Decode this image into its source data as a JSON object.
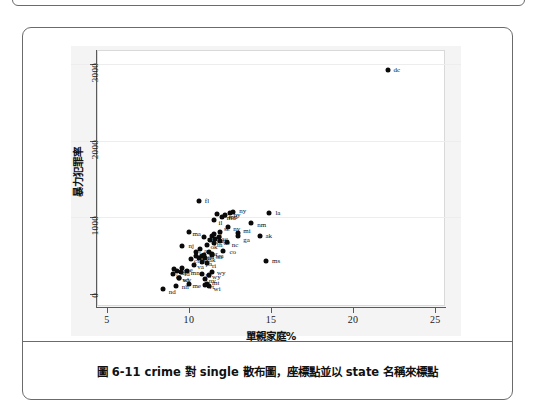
{
  "figure": {
    "caption": "圖 6-11   crime 對 single 散布圖，座標點並以 state 名稱來標點"
  },
  "chart_data": {
    "type": "scatter",
    "title": "",
    "xlabel": "單親家庭%",
    "ylabel": "暴力犯罪率",
    "xlim": [
      4.4,
      25.6
    ],
    "ylim": [
      -170,
      3180
    ],
    "xticks": [
      "5",
      "10",
      "15",
      "20",
      "25"
    ],
    "xtick_values": [
      5,
      10,
      15,
      20,
      25
    ],
    "yticks": [
      "0",
      "1000",
      "2000",
      "3000"
    ],
    "ytick_values": [
      0,
      1000,
      2000,
      3000
    ],
    "grid": true,
    "gridlines_y": [
      1000,
      2000,
      3000
    ],
    "legend": "none",
    "marker": "filled-circle",
    "marker_color": "#0a0a0a",
    "points": [
      {
        "label": "dc",
        "x": 22.1,
        "y": 2922,
        "lx": 6,
        "ly": 0
      },
      {
        "label": "fl",
        "x": 10.6,
        "y": 1206,
        "lx": 6,
        "ly": 0
      },
      {
        "label": "la",
        "x": 14.9,
        "y": 1062,
        "lx": 6,
        "ly": 0
      },
      {
        "label": "ny",
        "x": 12.7,
        "y": 1074,
        "lx": 6,
        "ly": -1
      },
      {
        "label": "md",
        "x": 12.0,
        "y": 998,
        "lx": 5,
        "ly": 1
      },
      {
        "label": "il",
        "x": 11.5,
        "y": 960,
        "lx": 5,
        "ly": 3
      },
      {
        "label": "nm",
        "x": 13.8,
        "y": 930,
        "lx": 6,
        "ly": 2
      },
      {
        "label": "nv",
        "x": 12.4,
        "y": 875,
        "lx": 5,
        "ly": 2
      },
      {
        "label": "ak",
        "x": 14.3,
        "y": 761,
        "lx": 6,
        "ly": 0
      },
      {
        "label": "mi",
        "x": 13.0,
        "y": 792,
        "lx": 5,
        "ly": -2
      },
      {
        "label": "ga",
        "x": 13.0,
        "y": 756,
        "lx": 5,
        "ly": 4
      },
      {
        "label": "nc",
        "x": 12.3,
        "y": 679,
        "lx": 5,
        "ly": 3
      },
      {
        "label": "sc",
        "x": 11.9,
        "y": 805,
        "lx": 4,
        "ly": -3
      },
      {
        "label": "nj",
        "x": 9.6,
        "y": 627,
        "lx": 6,
        "ly": 0
      },
      {
        "label": "co",
        "x": 12.1,
        "y": 567,
        "lx": 6,
        "ly": 1
      },
      {
        "label": "ms",
        "x": 14.7,
        "y": 434,
        "lx": 6,
        "ly": 0
      },
      {
        "label": "ri",
        "x": 11.1,
        "y": 402,
        "lx": 5,
        "ly": 3
      },
      {
        "label": "wy",
        "x": 11.4,
        "y": 286,
        "lx": 5,
        "ly": 1
      },
      {
        "label": "nd",
        "x": 8.4,
        "y": 68,
        "lx": 6,
        "ly": 3
      },
      {
        "label": "nh",
        "x": 9.2,
        "y": 106,
        "lx": 6,
        "ly": 1
      },
      {
        "label": "mt",
        "x": 11.1,
        "y": 135,
        "lx": 5,
        "ly": -1
      },
      {
        "label": "wi",
        "x": 11.2,
        "y": 109,
        "lx": 5,
        "ly": 3
      },
      {
        "label": "tx",
        "x": 11.4,
        "y": 762,
        "lx": 0,
        "ly": 0
      },
      {
        "label": "al",
        "x": 11.5,
        "y": 780,
        "lx": 0,
        "ly": 0
      },
      {
        "label": "ca",
        "x": 11.7,
        "y": 1041,
        "lx": 0,
        "ly": 0
      },
      {
        "label": "de",
        "x": 11.9,
        "y": 686,
        "lx": 0,
        "ly": 0
      },
      {
        "label": "tn",
        "x": 11.5,
        "y": 670,
        "lx": 0,
        "ly": 0
      },
      {
        "label": "mo",
        "x": 10.9,
        "y": 744,
        "lx": 0,
        "ly": 0
      },
      {
        "label": "ar",
        "x": 10.7,
        "y": 593,
        "lx": 0,
        "ly": 0
      },
      {
        "label": "az",
        "x": 11.6,
        "y": 715,
        "lx": 0,
        "ly": 0
      },
      {
        "label": "ok",
        "x": 11.1,
        "y": 635,
        "lx": 0,
        "ly": 0
      },
      {
        "label": "oh",
        "x": 11.4,
        "y": 504,
        "lx": 0,
        "ly": 0
      },
      {
        "label": "ak2",
        "x": 11.0,
        "y": 463,
        "lx": 0,
        "ly": 0
      },
      {
        "label": "in",
        "x": 10.8,
        "y": 489,
        "lx": 0,
        "ly": 0
      },
      {
        "label": "ks",
        "x": 10.4,
        "y": 496,
        "lx": 0,
        "ly": 0
      },
      {
        "label": "wa",
        "x": 11.4,
        "y": 515,
        "lx": 0,
        "ly": 0
      },
      {
        "label": "or",
        "x": 11.2,
        "y": 542,
        "lx": 0,
        "ly": 0
      },
      {
        "label": "pa",
        "x": 10.8,
        "y": 418,
        "lx": 0,
        "ly": 0
      },
      {
        "label": "va",
        "x": 10.3,
        "y": 372,
        "lx": 0,
        "ly": 0
      },
      {
        "label": "ct",
        "x": 10.1,
        "y": 456,
        "lx": 0,
        "ly": 0
      },
      {
        "label": "ky",
        "x": 10.6,
        "y": 463,
        "lx": 0,
        "ly": 0
      },
      {
        "label": "ma",
        "x": 10.0,
        "y": 805,
        "lx": 0,
        "ly": 0
      },
      {
        "label": "ne",
        "x": 9.6,
        "y": 339,
        "lx": 0,
        "ly": 0
      },
      {
        "label": "wv",
        "x": 9.4,
        "y": 208,
        "lx": 0,
        "ly": 0
      },
      {
        "label": "ia",
        "x": 9.0,
        "y": 265,
        "lx": 0,
        "ly": 0
      },
      {
        "label": "mn",
        "x": 9.1,
        "y": 327,
        "lx": 0,
        "ly": 0
      },
      {
        "label": "id",
        "x": 9.5,
        "y": 282,
        "lx": 0,
        "ly": 0
      },
      {
        "label": "ut",
        "x": 9.3,
        "y": 301,
        "lx": 0,
        "ly": 0
      },
      {
        "label": "sd",
        "x": 9.4,
        "y": 208,
        "lx": 0,
        "ly": 0
      },
      {
        "label": "me",
        "x": 10.0,
        "y": 126,
        "lx": 0,
        "ly": 0
      },
      {
        "label": "vt",
        "x": 11.0,
        "y": 114,
        "lx": 0,
        "ly": 0
      },
      {
        "label": "hi",
        "x": 10.8,
        "y": 261,
        "lx": 0,
        "ly": 0
      },
      {
        "label": "mn2",
        "x": 9.9,
        "y": 303,
        "lx": 0,
        "ly": 0
      },
      {
        "label": "la2",
        "x": 10.4,
        "y": 543,
        "lx": 0,
        "ly": 0
      },
      {
        "label": "ny2",
        "x": 12.5,
        "y": 1055,
        "lx": 0,
        "ly": 0
      },
      {
        "label": "md2",
        "x": 12.2,
        "y": 1030,
        "lx": 0,
        "ly": 0
      },
      {
        "label": "sc2",
        "x": 11.8,
        "y": 744,
        "lx": 0,
        "ly": 0
      },
      {
        "label": "fl2",
        "x": 11.3,
        "y": 704,
        "lx": 0,
        "ly": 0
      },
      {
        "label": "oh2",
        "x": 10.9,
        "y": 508,
        "lx": 0,
        "ly": 0
      },
      {
        "label": "nv2",
        "x": 11.0,
        "y": 194,
        "lx": 0,
        "ly": 0
      },
      {
        "label": "wy2",
        "x": 11.2,
        "y": 253,
        "lx": 0,
        "ly": 0
      }
    ]
  }
}
